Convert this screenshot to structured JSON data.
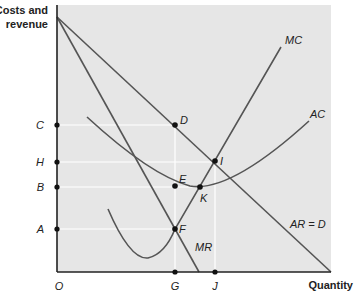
{
  "axes": {
    "y_label_line1": "Costs and",
    "y_label_line2": "revenue",
    "x_label": "Quantity",
    "origin": "O"
  },
  "y_ticks": [
    {
      "label": "C",
      "y": 125
    },
    {
      "label": "H",
      "y": 162
    },
    {
      "label": "B",
      "y": 187
    },
    {
      "label": "A",
      "y": 229
    }
  ],
  "x_ticks": [
    {
      "label": "G",
      "x": 175
    },
    {
      "label": "J",
      "x": 215
    }
  ],
  "points": [
    {
      "label": "D",
      "x": 175,
      "y": 125
    },
    {
      "label": "I",
      "x": 215,
      "y": 161
    },
    {
      "label": "E",
      "x": 175,
      "y": 186
    },
    {
      "label": "K",
      "x": 200,
      "y": 187
    },
    {
      "label": "F",
      "x": 175,
      "y": 229
    }
  ],
  "curves": {
    "mc": "MC",
    "ac": "AC",
    "mr": "MR",
    "ar": "AR = D"
  },
  "colors": {
    "plot_bg": "#e6e6e6",
    "curve": "#555555",
    "axis": "#222222",
    "guide": "#ffffff"
  }
}
